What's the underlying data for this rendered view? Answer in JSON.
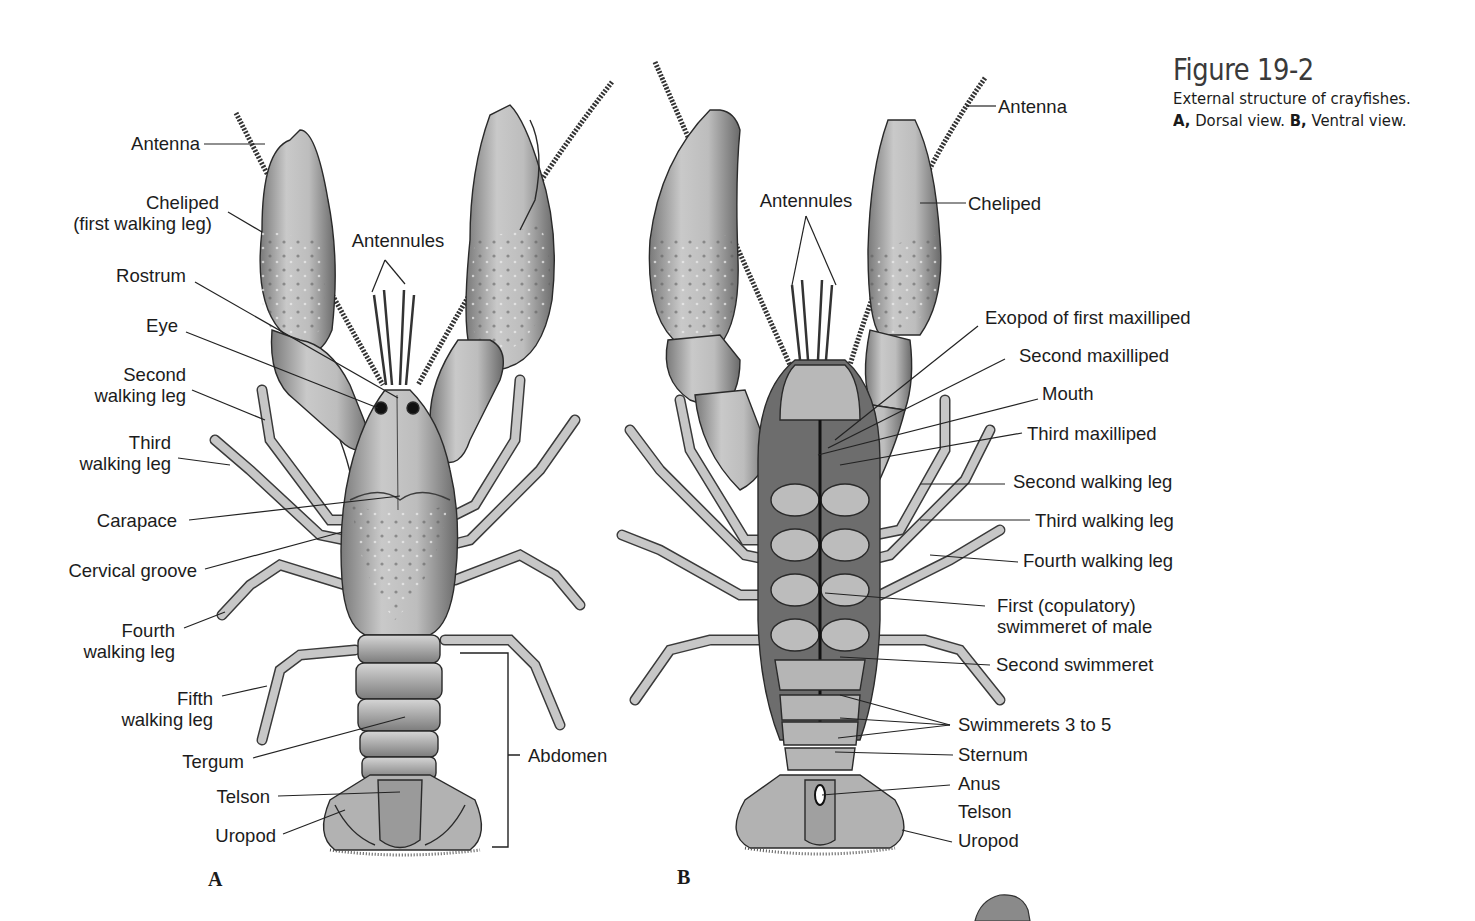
{
  "figure": {
    "title": "Figure 19-2",
    "caption_line1": "External structure of crayfishes.",
    "caption_line2_a_letter": "A,",
    "caption_line2_a_text": " Dorsal view. ",
    "caption_line2_b_letter": "B,",
    "caption_line2_b_text": " Ventral view."
  },
  "colors": {
    "background": "#ffffff",
    "text": "#1c1c1c",
    "leader_line": "#222222",
    "shell_fill": "#b9b9b9",
    "shell_dark": "#6e6e6e",
    "shell_light": "#d8d8d8",
    "outline": "#2a2a2a"
  },
  "panels": {
    "dorsal": {
      "letter": "A",
      "view": "Dorsal view",
      "labels": [
        {
          "id": "antenna",
          "text": "Antenna"
        },
        {
          "id": "cheliped_1",
          "text": "Cheliped"
        },
        {
          "id": "cheliped_2",
          "text": "(first walking leg)"
        },
        {
          "id": "antennules",
          "text": "Antennules"
        },
        {
          "id": "rostrum",
          "text": "Rostrum"
        },
        {
          "id": "eye",
          "text": "Eye"
        },
        {
          "id": "second_leg_1",
          "text": "Second"
        },
        {
          "id": "second_leg_2",
          "text": "walking leg"
        },
        {
          "id": "third_leg_1",
          "text": "Third"
        },
        {
          "id": "third_leg_2",
          "text": "walking leg"
        },
        {
          "id": "carapace",
          "text": "Carapace"
        },
        {
          "id": "cervical_groove",
          "text": "Cervical groove"
        },
        {
          "id": "fourth_leg_1",
          "text": "Fourth"
        },
        {
          "id": "fourth_leg_2",
          "text": "walking leg"
        },
        {
          "id": "fifth_leg_1",
          "text": "Fifth"
        },
        {
          "id": "fifth_leg_2",
          "text": "walking leg"
        },
        {
          "id": "tergum",
          "text": "Tergum"
        },
        {
          "id": "telson",
          "text": "Telson"
        },
        {
          "id": "uropod",
          "text": "Uropod"
        },
        {
          "id": "abdomen",
          "text": "Abdomen"
        }
      ]
    },
    "ventral": {
      "letter": "B",
      "view": "Ventral view",
      "labels": [
        {
          "id": "antenna",
          "text": "Antenna"
        },
        {
          "id": "antennules",
          "text": "Antennules"
        },
        {
          "id": "cheliped",
          "text": "Cheliped"
        },
        {
          "id": "exopod",
          "text": "Exopod of first maxilliped"
        },
        {
          "id": "second_maxilliped",
          "text": "Second maxilliped"
        },
        {
          "id": "mouth",
          "text": "Mouth"
        },
        {
          "id": "third_maxilliped",
          "text": "Third maxilliped"
        },
        {
          "id": "second_leg",
          "text": "Second walking leg"
        },
        {
          "id": "third_leg",
          "text": "Third walking leg"
        },
        {
          "id": "fourth_leg",
          "text": "Fourth walking leg"
        },
        {
          "id": "first_swimmeret_1",
          "text": "First (copulatory)"
        },
        {
          "id": "first_swimmeret_2",
          "text": "swimmeret of male"
        },
        {
          "id": "second_swimmeret",
          "text": "Second swimmeret"
        },
        {
          "id": "swimmerets_3_5",
          "text": "Swimmerets 3 to 5"
        },
        {
          "id": "sternum",
          "text": "Sternum"
        },
        {
          "id": "anus",
          "text": "Anus"
        },
        {
          "id": "telson",
          "text": "Telson"
        },
        {
          "id": "uropod",
          "text": "Uropod"
        }
      ]
    }
  }
}
